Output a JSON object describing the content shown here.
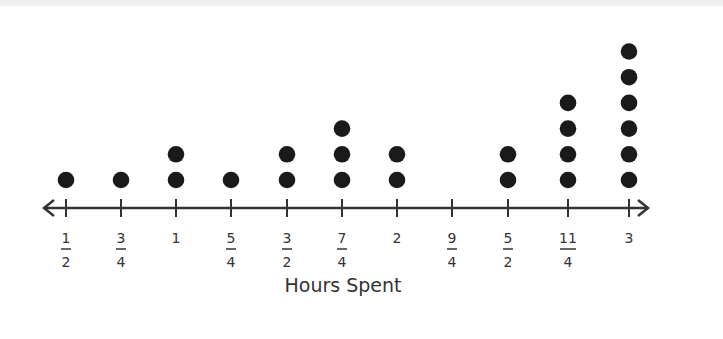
{
  "chart_data": {
    "type": "dot_plot",
    "title": "",
    "xlabel": "Hours Spent",
    "ylabel": "",
    "categories": [
      "1/2",
      "3/4",
      "1",
      "5/4",
      "3/2",
      "7/4",
      "2",
      "9/4",
      "5/2",
      "11/4",
      "3"
    ],
    "x": [
      0.5,
      0.75,
      1.0,
      1.25,
      1.5,
      1.75,
      2.0,
      2.25,
      2.5,
      2.75,
      3.0
    ],
    "values": [
      1,
      1,
      2,
      1,
      2,
      3,
      2,
      0,
      2,
      4,
      6
    ],
    "xlim": [
      0.5,
      3.0
    ],
    "grid": false,
    "legend": null,
    "tick_labels": [
      {
        "num": "1",
        "den": "2"
      },
      {
        "num": "3",
        "den": "4"
      },
      {
        "num": "1",
        "den": ""
      },
      {
        "num": "5",
        "den": "4"
      },
      {
        "num": "3",
        "den": "2"
      },
      {
        "num": "7",
        "den": "4"
      },
      {
        "num": "2",
        "den": ""
      },
      {
        "num": "9",
        "den": "4"
      },
      {
        "num": "5",
        "den": "2"
      },
      {
        "num": "11",
        "den": "4"
      },
      {
        "num": "3",
        "den": ""
      }
    ],
    "colors": {
      "dot": "#1a1a1a",
      "axis": "#333333",
      "text": "#333333"
    }
  }
}
